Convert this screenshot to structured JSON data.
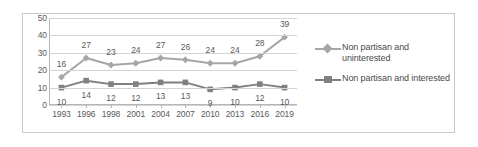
{
  "chart_data": {
    "type": "line",
    "title": "",
    "subtitle": "",
    "xlabel": "",
    "ylabel": "",
    "categories": [
      "1993",
      "1996",
      "1998",
      "2001",
      "2004",
      "2007",
      "2010",
      "2013",
      "2016",
      "2019"
    ],
    "series": [
      {
        "name": "Non partisan and uninterested",
        "marker": "diamond",
        "color": "#a6a6a6",
        "values": [
          16,
          27,
          23,
          24,
          27,
          26,
          24,
          24,
          28,
          39
        ]
      },
      {
        "name": "Non partisan and interested",
        "marker": "square",
        "color": "#808080",
        "values": [
          10,
          14,
          12,
          12,
          13,
          13,
          9,
          10,
          12,
          10
        ]
      }
    ],
    "ylim": [
      0,
      50
    ],
    "yticks": [
      "0",
      "10",
      "20",
      "30",
      "40",
      "50"
    ],
    "grid": "horizontal",
    "legend_position": "right",
    "data_labels": true
  },
  "legend": {
    "entries": [
      {
        "label_line1": "Non partisan and",
        "label_line2": "uninterested",
        "key_icon": "diamond-marker-icon"
      },
      {
        "label_line1": "Non partisan and interested",
        "label_line2": "",
        "key_icon": "square-marker-icon"
      }
    ]
  },
  "colors": {
    "series_uninterested": "#a6a6a6",
    "series_interested": "#808080",
    "gridline": "#d4d4d4",
    "axis": "#b6b6b6",
    "border": "#c9c9c9",
    "text": "#5a5a5a"
  }
}
